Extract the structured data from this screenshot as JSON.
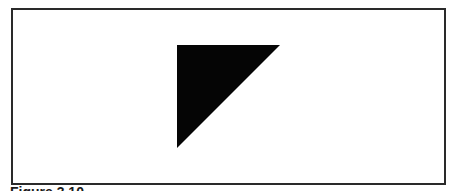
{
  "figure": {
    "caption": "Figure 3.10",
    "shape": {
      "type": "right-triangle",
      "fill": "#050505",
      "points": [
        [
          177,
          45
        ],
        [
          280,
          45
        ],
        [
          177,
          148
        ]
      ]
    },
    "frame_color": "#2a2a2a"
  }
}
